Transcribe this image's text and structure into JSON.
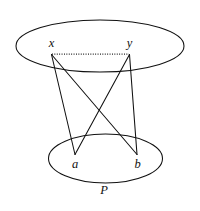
{
  "figure": {
    "background_color": "#ffffff",
    "stroke_color": "#101010",
    "width": 200,
    "height": 211,
    "regions": [
      {
        "id": "upper-oval",
        "name": "upper-region",
        "label": "",
        "cx": 100,
        "cy": 46,
        "rx": 84,
        "ry": 26
      },
      {
        "id": "lower-oval",
        "name": "lower-region",
        "label": "P",
        "cx": 105.5,
        "cy": 158.5,
        "rx": 57,
        "ry": 24.5
      }
    ],
    "nodes": [
      {
        "id": "x",
        "label": "x",
        "x": 51.5,
        "y": 54.5,
        "label_x": 51.5,
        "label_y": 46.5
      },
      {
        "id": "y",
        "label": "y",
        "x": 129.5,
        "y": 54.5,
        "label_x": 129.5,
        "label_y": 46.5
      },
      {
        "id": "a",
        "label": "a",
        "x": 75.0,
        "y": 154.5,
        "label_x": 75.0,
        "label_y": 168.0
      },
      {
        "id": "b",
        "label": "b",
        "x": 137.0,
        "y": 154.5,
        "label_x": 137.5,
        "label_y": 168.0
      }
    ],
    "set_labels": [
      {
        "id": "P",
        "label": "P",
        "x": 104.0,
        "y": 194.0
      }
    ],
    "edges": [
      {
        "id": "x-y",
        "from": "x",
        "to": "y",
        "style": "dotted"
      },
      {
        "id": "x-a",
        "from": "x",
        "to": "a",
        "style": "solid"
      },
      {
        "id": "x-b",
        "from": "x",
        "to": "b",
        "style": "solid"
      },
      {
        "id": "y-a",
        "from": "y",
        "to": "a",
        "style": "solid"
      },
      {
        "id": "y-b",
        "from": "y",
        "to": "b",
        "style": "solid"
      }
    ]
  }
}
